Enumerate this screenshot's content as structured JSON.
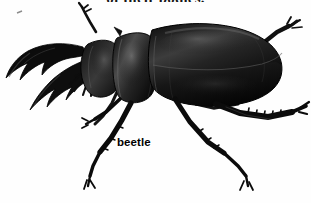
{
  "page": {
    "background_color": "#ffffff",
    "width": 311,
    "height": 203
  },
  "running_text": {
    "clipped_line": "of their bodies.",
    "color": "#161616"
  },
  "figure": {
    "caption": "beetle",
    "caption_color": "#000000",
    "view": "side-profile left-facing",
    "body_color": "#0b0b0b",
    "shade_color": "#2e2e2e",
    "highlight_color": "#6b6b6b",
    "outline_color": "#000000",
    "parts": [
      {
        "name": "left-mandible",
        "label": "mandible"
      },
      {
        "name": "right-mandible",
        "label": "mandible"
      },
      {
        "name": "head",
        "label": "head"
      },
      {
        "name": "pronotum",
        "label": "pronotum"
      },
      {
        "name": "elytra",
        "label": "elytra"
      },
      {
        "name": "antenna",
        "label": "antenna"
      },
      {
        "name": "foreleg",
        "label": "foreleg"
      },
      {
        "name": "midleg",
        "label": "midleg"
      },
      {
        "name": "hindleg",
        "label": "hindleg"
      }
    ]
  }
}
